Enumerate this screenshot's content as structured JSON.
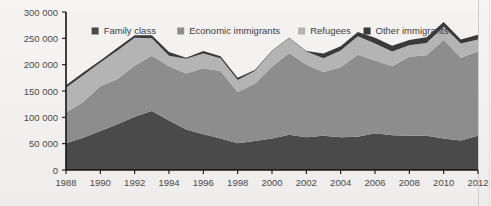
{
  "chart_data": {
    "type": "area",
    "stacked": true,
    "title": "",
    "subtitle": "",
    "xlabel": "",
    "ylabel": "",
    "x": [
      1988,
      1989,
      1990,
      1991,
      1992,
      1993,
      1994,
      1995,
      1996,
      1997,
      1998,
      1999,
      2000,
      2001,
      2002,
      2003,
      2004,
      2005,
      2006,
      2007,
      2008,
      2009,
      2010,
      2011,
      2012
    ],
    "xtick_labels": [
      "1988",
      "1990",
      "1992",
      "1994",
      "1996",
      "1998",
      "2000",
      "2002",
      "2004",
      "2006",
      "2008",
      "2010",
      "2012"
    ],
    "xlim": [
      1988,
      2012
    ],
    "ylim": [
      0,
      300000
    ],
    "ytick_values": [
      0,
      50000,
      100000,
      150000,
      200000,
      250000,
      300000
    ],
    "ytick_labels": [
      "0",
      "50 000",
      "100 000",
      "150 000",
      "200 000",
      "250 000",
      "300 000"
    ],
    "grid": false,
    "legend_position": "top-inside",
    "series": [
      {
        "name": "Family class",
        "color": "#4a4a4a",
        "values": [
          51000,
          61000,
          74000,
          87000,
          101000,
          112000,
          94000,
          77000,
          68000,
          60000,
          51000,
          55000,
          60000,
          67000,
          62000,
          65000,
          62000,
          63000,
          70000,
          66000,
          65000,
          65000,
          60000,
          56000,
          65000
        ]
      },
      {
        "name": "Economic immigrants",
        "color": "#8d8d8d",
        "values": [
          58000,
          68000,
          85000,
          86000,
          97000,
          105000,
          103000,
          106000,
          125000,
          128000,
          97000,
          109000,
          136000,
          155000,
          138000,
          121000,
          133000,
          156000,
          138000,
          131000,
          150000,
          153000,
          187000,
          157000,
          160000
        ]
      },
      {
        "name": "Refugees",
        "color": "#b4b4b4",
        "values": [
          47000,
          51000,
          45000,
          54000,
          53000,
          33000,
          20000,
          28000,
          28000,
          24000,
          23000,
          24000,
          30000,
          28000,
          25000,
          26000,
          32000,
          35000,
          32000,
          28000,
          22000,
          23000,
          25000,
          27000,
          23000
        ]
      },
      {
        "name": "Other immigrants",
        "color": "#3a3a3a",
        "values": [
          5000,
          5000,
          4000,
          5000,
          5000,
          6000,
          7000,
          2000,
          5000,
          4000,
          4000,
          2000,
          1000,
          1000,
          1000,
          9000,
          8000,
          8000,
          11000,
          11000,
          10000,
          11000,
          9000,
          8000,
          9000
        ]
      }
    ],
    "totals": [
      161000,
      185000,
      208000,
      232000,
      256000,
      256000,
      224000,
      213000,
      226000,
      216000,
      175000,
      190000,
      227000,
      251000,
      226000,
      221000,
      235000,
      262000,
      251000,
      236000,
      247000,
      252000,
      281000,
      248000,
      257000
    ]
  },
  "legend": {
    "items": [
      {
        "label": "Family class",
        "color": "#4a4a4a"
      },
      {
        "label": "Economic immigrants",
        "color": "#8d8d8d"
      },
      {
        "label": "Refugees",
        "color": "#b4b4b4"
      },
      {
        "label": "Other immigrants",
        "color": "#3a3a3a"
      }
    ]
  },
  "axis": {
    "y_ticks": [
      "300 000",
      "250 000",
      "200 000",
      "150 000",
      "100 000",
      "50 000",
      "0"
    ],
    "x_ticks": [
      "1988",
      "1990",
      "1992",
      "1994",
      "1996",
      "1998",
      "2000",
      "2002",
      "2004",
      "2006",
      "2008",
      "2010",
      "2012"
    ]
  }
}
